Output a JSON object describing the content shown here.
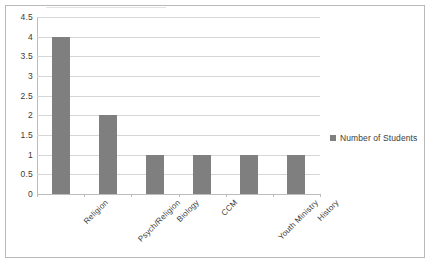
{
  "chart_data": {
    "type": "bar",
    "title": "",
    "xlabel": "",
    "ylabel": "",
    "categories": [
      "Religion",
      "Psych/Religion",
      "Biology",
      "CCM",
      "Youth Ministry",
      "History"
    ],
    "values": [
      4,
      2,
      1,
      1,
      1,
      1
    ],
    "series": [
      {
        "name": "Number of Students",
        "values": [
          4,
          2,
          1,
          1,
          1,
          1
        ],
        "color": "#7f7f7f"
      }
    ],
    "ylim": [
      0,
      4.5
    ],
    "ytick_labels": [
      "0",
      "0.5",
      "1",
      "1.5",
      "2",
      "2.5",
      "3",
      "3.5",
      "4",
      "4.5"
    ],
    "ytick_values": [
      0,
      0.5,
      1,
      1.5,
      2,
      2.5,
      3,
      3.5,
      4,
      4.5
    ],
    "grid": true,
    "grid_axis": "y",
    "legend": {
      "position": "right",
      "entries": [
        "Number of Students"
      ]
    },
    "xtick_label_rotation": -45,
    "bar_color": "#7f7f7f",
    "gridline_color": "#d6d6d6",
    "axis_color": "#bcbcbc",
    "border_color": "#b9b9b9",
    "text_color": "#3b3b3b",
    "background": "#ffffff"
  }
}
